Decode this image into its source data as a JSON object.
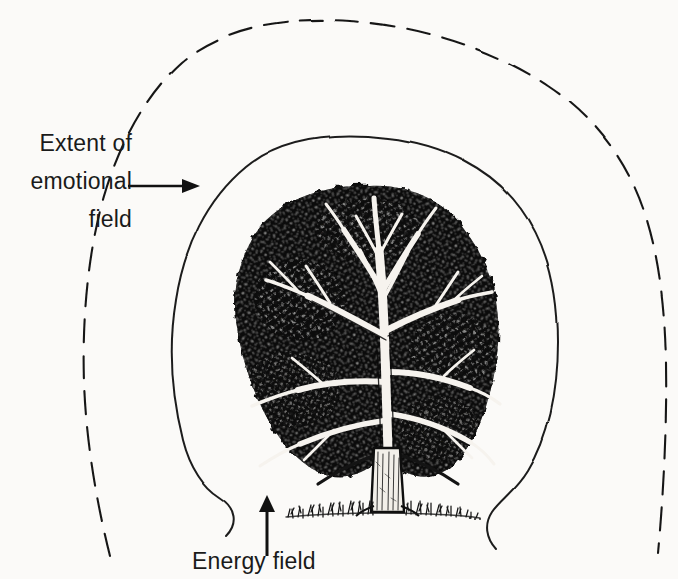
{
  "figure": {
    "type": "diagram",
    "background_color": "#fbfaf8",
    "ink_color": "#111111"
  },
  "labels": {
    "emotional_field": {
      "lines": [
        "Extent of",
        "emotional",
        "field"
      ],
      "full_text": "Extent of emotional field",
      "arrow": "right-arrow",
      "arrow_direction": "right"
    },
    "energy_field": {
      "text": "Energy field",
      "arrow": "up-arrow",
      "arrow_direction": "up"
    }
  },
  "elements": {
    "outer_boundary": {
      "name": "extent-of-emotional-field-boundary",
      "style": "dashed",
      "color": "#181818"
    },
    "inner_boundary": {
      "name": "energy-field-boundary",
      "style": "solid",
      "color": "#1d1d1d"
    },
    "tree": {
      "name": "tree-illustration",
      "parts": [
        "canopy",
        "branches",
        "trunk",
        "ground-grass"
      ],
      "canopy_color": "#0d0d0d",
      "trunk_color": "#f2efe9"
    },
    "ground": {
      "name": "ground-grass-line",
      "color": "#1a1a1a"
    }
  }
}
